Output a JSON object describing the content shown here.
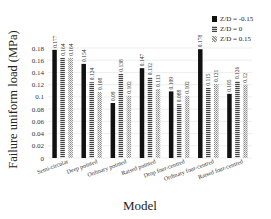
{
  "chart_data": {
    "type": "bar",
    "title": "",
    "xlabel": "Model",
    "ylabel": "Failure uniform load (MPa)",
    "ylim": [
      0,
      0.18
    ],
    "yticks": [
      "0",
      "0.02",
      "0.04",
      "0.06",
      "0.08",
      "0.1",
      "0.12",
      "0.14",
      "0.16",
      "0.18"
    ],
    "grid": true,
    "legend_position": "top-right",
    "categories": [
      "Semi-circular",
      "Deep pointed",
      "Ordinary pointed",
      "Raised pointed",
      "Drop four-centred",
      "Ordinary four-centred",
      "Raised four-centred"
    ],
    "series": [
      {
        "name": "Z/D = -0.15",
        "pattern": "solid-black",
        "values": [
          0.177,
          0.154,
          0.09,
          0.147,
          0.109,
          0.178,
          0.105
        ]
      },
      {
        "name": "Z/D = 0",
        "pattern": "dotted-dark",
        "values": [
          0.164,
          0.124,
          0.138,
          0.132,
          0.088,
          0.115,
          0.126
        ]
      },
      {
        "name": "Z/D = 0.15",
        "pattern": "hatched-light",
        "values": [
          0.164,
          0.108,
          0.102,
          0.113,
          0.102,
          0.121,
          0.12
        ]
      }
    ],
    "value_labels": [
      [
        "0.177",
        "0.164",
        "0.164"
      ],
      [
        "0.154",
        "0.124",
        "0.108"
      ],
      [
        "0.09",
        "0.138",
        "0.102"
      ],
      [
        "0.147",
        "0.132",
        "0.113"
      ],
      [
        "0.109",
        "0.088",
        "0.102"
      ],
      [
        "0.178",
        "0.115",
        "0.121"
      ],
      [
        "0.105",
        "0.126",
        "0.12"
      ]
    ]
  },
  "labels": {
    "xlabel": "Model",
    "ylabel": "Failure uniform load (MPa)",
    "legend": [
      "Z/D = -0.15",
      "Z/D = 0",
      "Z/D = 0.15"
    ]
  }
}
